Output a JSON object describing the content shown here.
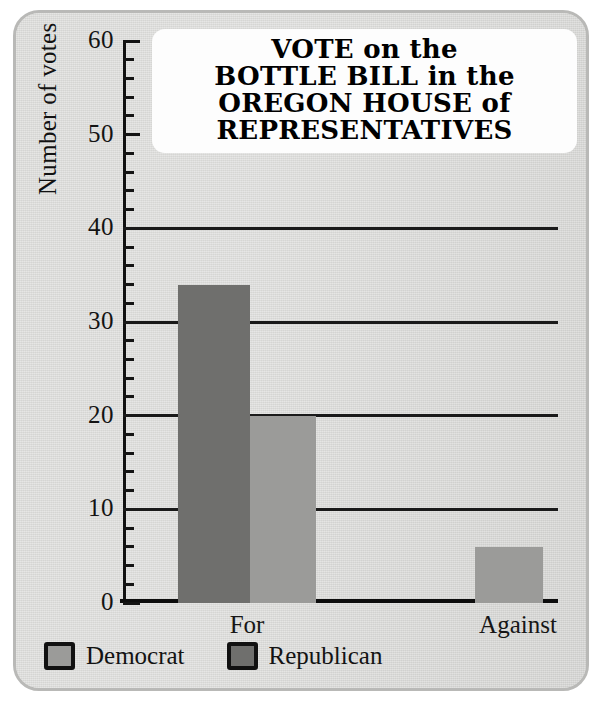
{
  "title_lines": [
    "VOTE on the",
    "BOTTLE   BILL in the",
    "OREGON   HOUSE of",
    "REPRESENTATIVES"
  ],
  "title_full": "VOTE on the BOTTLE BILL in the OREGON HOUSE of REPRESENTATIVES",
  "colors": {
    "democrat": "#9b9b99",
    "republican": "#6f6f6d",
    "card_background": "#d8d8d6",
    "card_border": "#b9b9b7",
    "axis": "#111111",
    "title_plate": "#fdfdfd"
  },
  "axis": {
    "y_title": "Number of votes",
    "y_ticks": [
      "0",
      "10",
      "20",
      "30",
      "40",
      "50",
      "60"
    ],
    "y_minor_step": 2,
    "x_categories": [
      "For",
      "Against"
    ]
  },
  "legend": {
    "items": [
      {
        "label": "Democrat",
        "key": "democrat"
      },
      {
        "label": "Republican",
        "key": "republican"
      }
    ]
  },
  "chart_data": {
    "type": "bar",
    "xlabel": "",
    "ylabel": "Number of votes",
    "ylim": [
      0,
      60
    ],
    "ytick_step": 10,
    "yminor_step": 2,
    "grid": "horizontal-major-only",
    "gridlines_at": [
      10,
      20,
      30,
      40
    ],
    "legend_position": "below-plot-left",
    "categories": [
      "For",
      "Against"
    ],
    "series": [
      {
        "name": "Republican",
        "color": "#6f6f6d",
        "values": [
          34,
          0
        ]
      },
      {
        "name": "Democrat",
        "color": "#9b9b99",
        "values": [
          20,
          6
        ]
      }
    ],
    "bars": [
      {
        "category": "For",
        "party": "Republican",
        "value": 34
      },
      {
        "category": "For",
        "party": "Democrat",
        "value": 20
      },
      {
        "category": "Against",
        "party": "Democrat",
        "value": 6
      }
    ]
  }
}
